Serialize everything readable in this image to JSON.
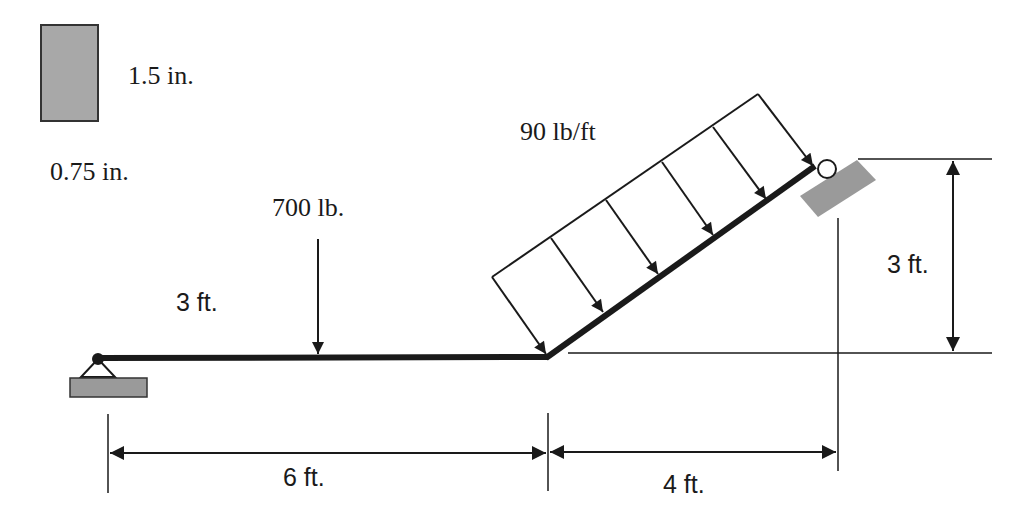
{
  "cross_section": {
    "height_label": "1.5 in.",
    "width_label": "0.75 in.",
    "fill_color": "#a8a8a8"
  },
  "loads": {
    "point_load_label": "700 lb.",
    "point_load_offset_label": "3 ft.",
    "distributed_load_label": "90 lb/ft"
  },
  "dimensions": {
    "horizontal_span_1": "6 ft.",
    "horizontal_span_2": "4 ft.",
    "vertical_rise": "3 ft."
  },
  "supports": {
    "left": "pin-support",
    "right": "roller-support-inclined",
    "ground_color": "#9a9a9a"
  },
  "colors": {
    "beam": "#1a1a1a",
    "line": "#1a1a1a"
  }
}
